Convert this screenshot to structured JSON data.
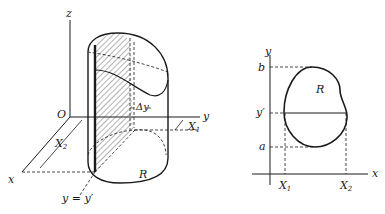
{
  "figure_left": {
    "axes": {
      "z": "z",
      "y": "y",
      "x": "x",
      "origin": "O"
    },
    "labels": {
      "delta_y": "Δy",
      "x1": "X",
      "x1_sub": "1",
      "x2": "X",
      "x2_sub": "2",
      "region": "R",
      "slice": "y = y′"
    }
  },
  "figure_right": {
    "axes": {
      "y": "y",
      "x": "x"
    },
    "labels": {
      "b": "b",
      "y_prime": "y′",
      "a": "a",
      "region": "R",
      "x1": "X",
      "x1_sub": "1",
      "x2": "X",
      "x2_sub": "2"
    }
  },
  "colors": {
    "ink": "#1a1a1a",
    "background": "#ffffff"
  }
}
